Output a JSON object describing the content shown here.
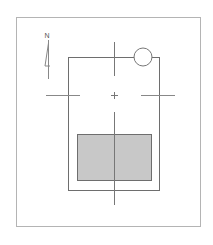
{
  "diagram": {
    "type": "site-plan",
    "north_label": "N",
    "colors": {
      "background": "#ffffff",
      "frame": "#b4b4b4",
      "building_outline": "#6e6e6e",
      "axis_lines": "#777777",
      "shaded_area": "#c8c8c8",
      "shaded_outline": "#6e6e6e",
      "circle_outline": "#777777"
    },
    "elements": {
      "frame": {
        "x": 16,
        "y": 17,
        "w": 184,
        "h": 209
      },
      "building": {
        "x": 68,
        "y": 57,
        "w": 91,
        "h": 133
      },
      "shaded_area": {
        "x": 77,
        "y": 134,
        "w": 74,
        "h": 46
      },
      "corner_circle": {
        "cx": 143,
        "cy": 57,
        "r": 9
      },
      "center_point": {
        "x": 114,
        "y": 95
      },
      "vertical_axis_top": {
        "x": 114,
        "y1": 42,
        "y2": 76
      },
      "vertical_axis_bottom": {
        "x": 114,
        "y1": 112,
        "y2": 205
      },
      "horizontal_axis_left": {
        "y": 95,
        "x1": 46,
        "x2": 80
      },
      "horizontal_axis_right": {
        "y": 95,
        "x1": 141,
        "x2": 175
      }
    }
  }
}
